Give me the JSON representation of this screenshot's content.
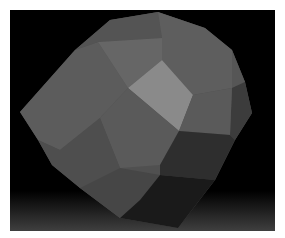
{
  "scene": {
    "subject": "gray low-poly polyhedron render",
    "background_color": "#000000",
    "border_color": "#ffffff",
    "floor_gradient_color": "#464646",
    "highlight_face_color": "#8a8a8a",
    "face_colors": {
      "lightest": "#8a8a8a",
      "light": "#6e6e6e",
      "mid": "#5f5f5f",
      "mid_dark": "#525252",
      "dark": "#3a3a3a",
      "darkest": "#1c1c1c"
    }
  }
}
